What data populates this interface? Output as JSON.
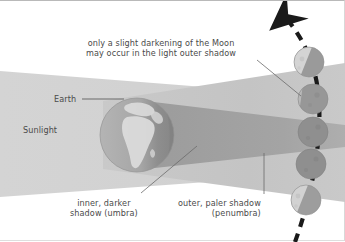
{
  "figure": {
    "background": "#ffffff"
  },
  "labels": {
    "top_note_line1": "only a slight darkening of the Moon",
    "top_note_line2": "may occur in the light outer shadow",
    "earth": "Earth",
    "sunlight": "Sunlight",
    "umbra_line1": "inner, darker",
    "umbra_line2": "shadow (umbra)",
    "penumbra_line1": "outer, paler shadow",
    "penumbra_line2": "(penumbra)"
  },
  "colors": {
    "text": "#4a4a4a",
    "sunlight_beam": "#d6d6d6",
    "penumbra": "#c2c2c2",
    "umbra": "#a0a0a0",
    "earth_ocean": "#a8a8a8",
    "earth_land": "#d9d9d9",
    "earth_night": "#8e8e8e",
    "moon_lit": "#d2d2d2",
    "moon_dark": "#8c8c8c",
    "orbit_dash": "#1a1a1a",
    "leader_line": "#6b6b6b",
    "frame": "#b9b9b9"
  },
  "diagram": {
    "earth": {
      "cx": 137,
      "cy": 134,
      "r": 37
    },
    "sunlight_beam": {
      "left_top": 70,
      "left_bottom": 196,
      "right_top": 95,
      "right_bottom": 172
    },
    "penumbra": {
      "apex_top": 97,
      "apex_bottom": 171,
      "right_top": 63,
      "right_bottom": 200
    },
    "umbra": {
      "base_top": 100,
      "base_bottom": 168,
      "tip_y": 134,
      "tip_x": 345
    },
    "orbit": {
      "style": "dashed",
      "direction": "upward-left",
      "arrowhead": true
    },
    "moons": [
      {
        "id": "moon-1",
        "cx": 309,
        "cy": 61,
        "r": 15,
        "state": "partially-lit"
      },
      {
        "id": "moon-2",
        "cx": 313,
        "cy": 98,
        "r": 15,
        "state": "mostly-dark"
      },
      {
        "id": "moon-3",
        "cx": 313,
        "cy": 131,
        "r": 15,
        "state": "dark"
      },
      {
        "id": "moon-4",
        "cx": 311,
        "cy": 163,
        "r": 15,
        "state": "dark"
      },
      {
        "id": "moon-5",
        "cx": 306,
        "cy": 199,
        "r": 15,
        "state": "partially-lit"
      }
    ],
    "leader_lines": [
      {
        "name": "note-to-moon2",
        "from": [
          258,
          60
        ],
        "to": [
          300,
          95
        ]
      },
      {
        "name": "umbra-pointer",
        "from": [
          140,
          192
        ],
        "to": [
          196,
          145
        ]
      },
      {
        "name": "penumbra-pointer",
        "from": [
          264,
          192
        ],
        "to": [
          264,
          153
        ]
      },
      {
        "name": "earth-pointer",
        "from": [
          82,
          98
        ],
        "to": [
          122,
          98
        ]
      }
    ]
  }
}
